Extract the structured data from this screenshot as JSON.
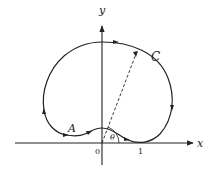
{
  "figure": {
    "curve_label": "C",
    "point_label": "A",
    "angle_label": "θ",
    "x_axis_label": "x",
    "y_axis_label": "y",
    "origin_label": "0",
    "tick_labels": [
      "1"
    ],
    "colors": {
      "stroke": "#222222",
      "background": "#ffffff"
    }
  }
}
